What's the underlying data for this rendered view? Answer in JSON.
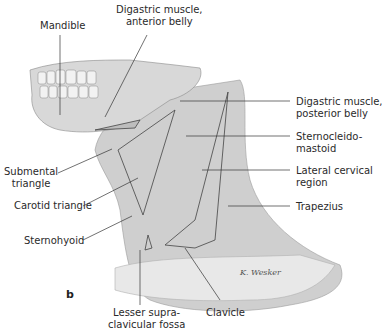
{
  "figure": {
    "panel_label": "b",
    "signature": "K. Wesker",
    "labels": {
      "mandible": "Mandible",
      "digastric_anterior": "Digastric muscle,\nanterior belly",
      "digastric_posterior": "Digastric muscle,\nposterior belly",
      "sternocleidomastoid": "Sternocleido-\nmastoid",
      "lateral_cervical": "Lateral cervical\nregion",
      "trapezius": "Trapezius",
      "submental": "Submental\ntriangle",
      "carotid": "Carotid triangle",
      "sternohyoid": "Sternohyoid",
      "lesser_supraclavicular": "Lesser supra-\nclavicular fossa",
      "clavicle": "Clavicle"
    }
  }
}
